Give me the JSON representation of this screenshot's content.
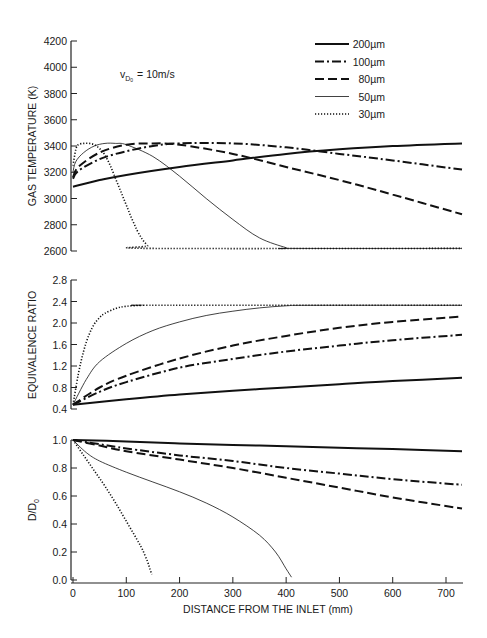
{
  "chart_data": [
    {
      "type": "line",
      "panel": "top",
      "title": "",
      "annotation": {
        "text_main": "v",
        "subscript": "D",
        "sub_subscript": "0",
        "text_rest": "= 10 m/s"
      },
      "xlabel": "DISTANCE FROM THE INLET (mm)",
      "ylabel": "GAS TEMPERATURE (K)",
      "xlim": [
        0,
        730
      ],
      "ylim": [
        2600,
        4200
      ],
      "yticks": [
        2600,
        2800,
        3000,
        3200,
        3400,
        3600,
        3800,
        4000,
        4200
      ],
      "ytick_labels": [
        "2600",
        "2800",
        "3000",
        "3200",
        "3400",
        "3600",
        "3800",
        "4000",
        "4200"
      ],
      "grid": false,
      "legend_position": "upper right",
      "series": [
        {
          "name": "200µm",
          "style": "solid-thick",
          "x": [
            0,
            50,
            100,
            200,
            300,
            400,
            500,
            600,
            730
          ],
          "values": [
            3090,
            3140,
            3180,
            3240,
            3290,
            3340,
            3375,
            3400,
            3420
          ]
        },
        {
          "name": "100µm",
          "style": "dash-dot",
          "x": [
            0,
            10,
            50,
            100,
            150,
            200,
            300,
            400,
            500,
            600,
            730
          ],
          "values": [
            3150,
            3210,
            3300,
            3360,
            3400,
            3420,
            3420,
            3390,
            3340,
            3290,
            3220
          ]
        },
        {
          "name": "80µm",
          "style": "dashed",
          "x": [
            0,
            10,
            50,
            100,
            150,
            200,
            300,
            400,
            500,
            600,
            730
          ],
          "values": [
            3160,
            3240,
            3350,
            3410,
            3420,
            3410,
            3340,
            3240,
            3140,
            3030,
            2880
          ]
        },
        {
          "name": "50µm",
          "style": "solid-thin",
          "x": [
            0,
            5,
            20,
            40,
            60,
            80,
            100,
            150,
            200,
            250,
            300,
            350,
            400,
            410,
            730
          ],
          "values": [
            3200,
            3280,
            3350,
            3400,
            3420,
            3420,
            3410,
            3320,
            3170,
            3000,
            2840,
            2700,
            2625,
            2620,
            2620
          ]
        },
        {
          "name": "30µm",
          "style": "dotted",
          "x": [
            0,
            5,
            10,
            20,
            30,
            40,
            50,
            60,
            70,
            80,
            90,
            100,
            110,
            120,
            130,
            140,
            145,
            730
          ],
          "values": [
            3250,
            3370,
            3410,
            3420,
            3420,
            3410,
            3380,
            3330,
            3250,
            3150,
            3050,
            2950,
            2850,
            2760,
            2690,
            2640,
            2620,
            2620
          ]
        }
      ]
    },
    {
      "type": "line",
      "panel": "middle",
      "ylabel": "EQUIVALENCE RATIO",
      "xlim": [
        0,
        730
      ],
      "ylim": [
        0.4,
        2.8
      ],
      "yticks": [
        0.4,
        0.8,
        1.2,
        1.6,
        2.0,
        2.4,
        2.8
      ],
      "ytick_labels": [
        "0.4",
        "0.8",
        "1.2",
        "1.6",
        "2.0",
        "2.4",
        "2.8"
      ],
      "grid": false,
      "series": [
        {
          "name": "200µm",
          "style": "solid-thick",
          "x": [
            0,
            100,
            200,
            300,
            400,
            500,
            600,
            730
          ],
          "values": [
            0.48,
            0.58,
            0.67,
            0.74,
            0.8,
            0.86,
            0.92,
            0.98
          ]
        },
        {
          "name": "100µm",
          "style": "dash-dot",
          "x": [
            0,
            50,
            100,
            200,
            300,
            400,
            500,
            600,
            730
          ],
          "values": [
            0.48,
            0.72,
            0.9,
            1.17,
            1.33,
            1.47,
            1.58,
            1.68,
            1.78
          ]
        },
        {
          "name": "80µm",
          "style": "dashed",
          "x": [
            0,
            50,
            100,
            200,
            300,
            400,
            500,
            600,
            730
          ],
          "values": [
            0.48,
            0.8,
            1.02,
            1.34,
            1.58,
            1.76,
            1.91,
            2.02,
            2.12
          ]
        },
        {
          "name": "50µm",
          "style": "solid-thin",
          "x": [
            0,
            25,
            50,
            100,
            150,
            200,
            250,
            300,
            350,
            400,
            450,
            730
          ],
          "values": [
            0.48,
            0.95,
            1.28,
            1.62,
            1.86,
            2.02,
            2.14,
            2.22,
            2.28,
            2.32,
            2.33,
            2.33
          ]
        },
        {
          "name": "30µm",
          "style": "dotted",
          "x": [
            0,
            10,
            20,
            30,
            40,
            50,
            60,
            80,
            100,
            130,
            160,
            730
          ],
          "values": [
            0.48,
            1.05,
            1.48,
            1.78,
            1.98,
            2.1,
            2.18,
            2.27,
            2.31,
            2.33,
            2.33,
            2.33
          ]
        }
      ]
    },
    {
      "type": "line",
      "panel": "bottom",
      "xlabel": "DISTANCE FROM THE INLET (mm)",
      "ylabel": "D/D0",
      "xlim": [
        0,
        730
      ],
      "ylim": [
        0.0,
        1.0
      ],
      "xticks": [
        0,
        100,
        200,
        300,
        400,
        500,
        600,
        700
      ],
      "xtick_labels": [
        "0",
        "100",
        "200",
        "300",
        "400",
        "500",
        "600",
        "700"
      ],
      "yticks": [
        0.0,
        0.2,
        0.4,
        0.6,
        0.8,
        1.0
      ],
      "ytick_labels": [
        "0.0",
        "0.2",
        "0.4",
        "0.6",
        "0.8",
        "1.0"
      ],
      "grid": false,
      "series": [
        {
          "name": "200µm",
          "style": "solid-thick",
          "x": [
            0,
            100,
            200,
            300,
            400,
            500,
            600,
            730
          ],
          "values": [
            1.0,
            0.99,
            0.975,
            0.965,
            0.955,
            0.945,
            0.935,
            0.92
          ]
        },
        {
          "name": "100µm",
          "style": "dash-dot",
          "x": [
            0,
            50,
            100,
            200,
            300,
            400,
            500,
            600,
            730
          ],
          "values": [
            1.0,
            0.97,
            0.94,
            0.89,
            0.85,
            0.8,
            0.76,
            0.72,
            0.68
          ]
        },
        {
          "name": "80µm",
          "style": "dashed",
          "x": [
            0,
            50,
            100,
            200,
            300,
            400,
            500,
            600,
            730
          ],
          "values": [
            1.0,
            0.96,
            0.92,
            0.86,
            0.8,
            0.73,
            0.66,
            0.59,
            0.51
          ]
        },
        {
          "name": "50µm",
          "style": "solid-thin",
          "x": [
            0,
            25,
            50,
            100,
            150,
            200,
            250,
            300,
            350,
            380,
            400,
            410
          ],
          "values": [
            1.0,
            0.91,
            0.85,
            0.77,
            0.7,
            0.63,
            0.55,
            0.45,
            0.32,
            0.2,
            0.08,
            0.02
          ]
        },
        {
          "name": "30µm",
          "style": "dotted",
          "x": [
            0,
            20,
            40,
            60,
            80,
            100,
            120,
            130,
            140,
            145,
            148
          ],
          "values": [
            1.0,
            0.89,
            0.78,
            0.67,
            0.55,
            0.42,
            0.29,
            0.22,
            0.13,
            0.07,
            0.04
          ]
        }
      ]
    }
  ],
  "legend": {
    "items": [
      {
        "label": "200µm",
        "style": "solid-thick"
      },
      {
        "label": "100µm",
        "style": "dash-dot"
      },
      {
        "label": "80µm",
        "style": "dashed"
      },
      {
        "label": "50µm",
        "style": "solid-thin"
      },
      {
        "label": "30µm",
        "style": "dotted"
      }
    ]
  },
  "labels": {
    "ylabel_top": "GAS TEMPERATURE (K)",
    "ylabel_middle": "EQUIVALENCE RATIO",
    "ylabel_bottom_main": "D/D",
    "ylabel_bottom_sub": "0",
    "xlabel": "DISTANCE FROM THE INLET (mm)",
    "annotation_v": "v",
    "annotation_sub": "D",
    "annotation_subsub": "0",
    "annotation_rest": "= 10m/s"
  }
}
